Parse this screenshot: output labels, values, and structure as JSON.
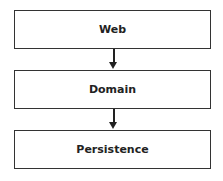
{
  "diagram": {
    "layers": [
      {
        "label": "Web"
      },
      {
        "label": "Domain"
      },
      {
        "label": "Persistence"
      }
    ],
    "edges": [
      {
        "from": "Web",
        "to": "Domain"
      },
      {
        "from": "Domain",
        "to": "Persistence"
      }
    ]
  }
}
